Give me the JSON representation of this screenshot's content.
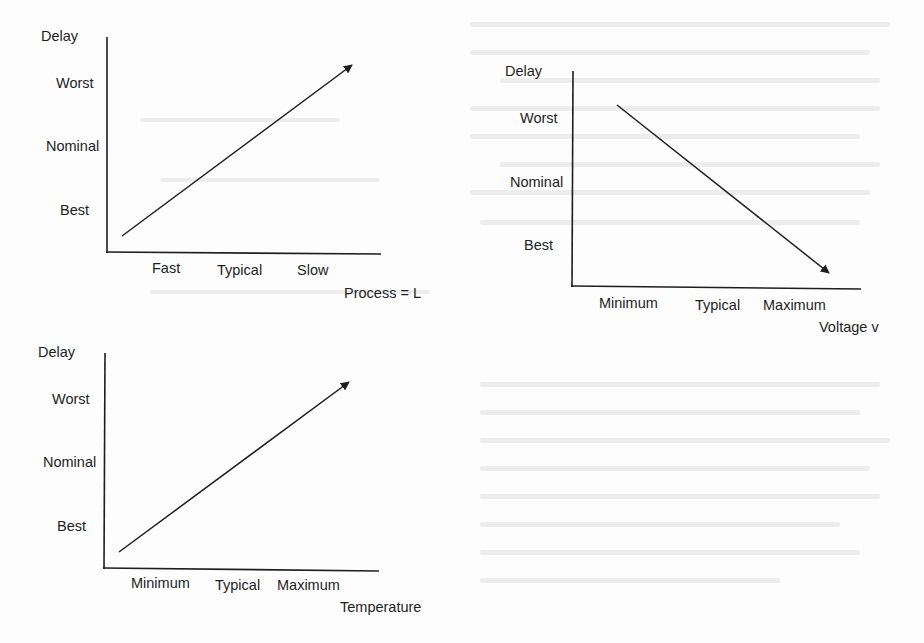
{
  "diagrams": [
    {
      "id": "process",
      "y_axis_title": "Delay",
      "y_levels": [
        "Worst",
        "Nominal",
        "Best"
      ],
      "x_ticks": [
        "Fast",
        "Typical",
        "Slow"
      ],
      "x_axis_title": "Process = L",
      "trend": "increasing"
    },
    {
      "id": "voltage",
      "y_axis_title": "Delay",
      "y_levels": [
        "Worst",
        "Nominal",
        "Best"
      ],
      "x_ticks": [
        "Minimum",
        "Typical",
        "Maximum"
      ],
      "x_axis_title": "Voltage v",
      "trend": "decreasing"
    },
    {
      "id": "temperature",
      "y_axis_title": "Delay",
      "y_levels": [
        "Worst",
        "Nominal",
        "Best"
      ],
      "x_ticks": [
        "Minimum",
        "Typical",
        "Maximum"
      ],
      "x_axis_title": "Temperature",
      "trend": "increasing"
    }
  ],
  "colors": {
    "line": "#1e1e1e",
    "background": "#fdfdfd"
  }
}
